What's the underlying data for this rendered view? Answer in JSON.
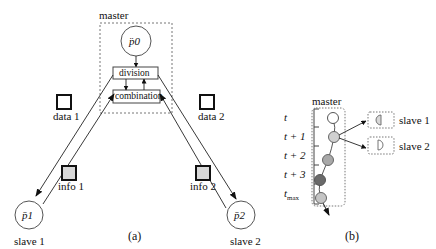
{
  "panel_a": {
    "caption": "(a)",
    "master_label": "master",
    "master_node": "p̈0",
    "division_label": "division",
    "combination_label": "combination",
    "data1_label": "data 1",
    "data2_label": "data 2",
    "info1_label": "info 1",
    "info2_label": "info 2",
    "slave1_node": "p̄1",
    "slave2_node": "p̄2",
    "slave1_label": "slave 1",
    "slave2_label": "slave 2"
  },
  "panel_b": {
    "caption": "(b)",
    "master_label": "master",
    "time_ticks": [
      "t",
      "t + 1",
      "t + 2",
      "t + 3",
      "t_max"
    ],
    "slave1_label": "slave 1",
    "slave2_label": "slave 2",
    "node_colors": [
      "#ffffff",
      "#d0d0d0",
      "#a8a8a8",
      "#6a6a6a",
      "#c4c4c4"
    ]
  },
  "colors": {
    "stroke": "#222222",
    "dashed": "#777777",
    "info_fill": "#d8d8d8"
  }
}
